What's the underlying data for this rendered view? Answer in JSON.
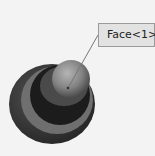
{
  "viewport": {
    "callout": {
      "label": "Face<1>"
    },
    "model": {
      "description": "stacked disc and dome part, grayscale shaded"
    }
  },
  "colors": {
    "background": "#f3f3f3",
    "outer_ring": "#3a3a3a",
    "mid_ring": "#777777",
    "inner_disc": "#1e1e1e",
    "dome": "#8a8a8a",
    "callout_fill": "#e2e2e2",
    "callout_border": "#9a9a9a"
  }
}
